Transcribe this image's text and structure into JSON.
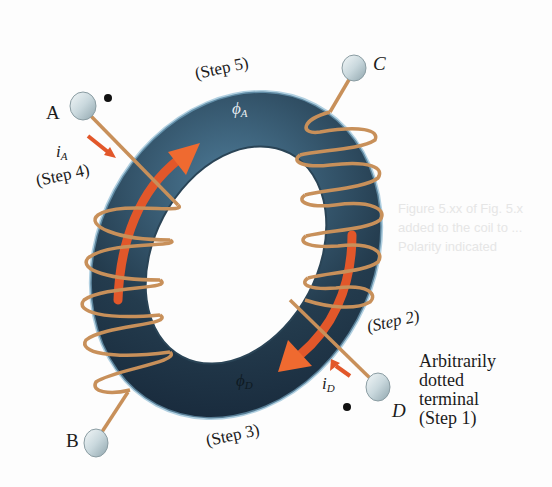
{
  "figure": {
    "type": "toroidal transformer dot-convention diagram",
    "terminals": [
      {
        "id": "A",
        "label": "A",
        "dotted": true
      },
      {
        "id": "B",
        "label": "B",
        "dotted": false
      },
      {
        "id": "C",
        "label": "C",
        "dotted": false
      },
      {
        "id": "D",
        "label": "D",
        "dotted": true
      }
    ],
    "currents": {
      "iA": {
        "symbol": "i",
        "subscript": "A"
      },
      "iD": {
        "symbol": "i",
        "subscript": "D"
      }
    },
    "fluxes": {
      "phiA": {
        "symbol": "ϕ",
        "subscript": "A"
      },
      "phiD": {
        "symbol": "ϕ",
        "subscript": "D"
      }
    },
    "steps": {
      "step1": "(Step 1)",
      "step2": "(Step 2)",
      "step3": "(Step 3)",
      "step4": "(Step 4)",
      "step5": "(Step 5)"
    },
    "note": {
      "line1": "Arbitrarily",
      "line2": "dotted",
      "line3": "terminal",
      "line4": "(Step 1)"
    },
    "colors": {
      "core": "#1f3444",
      "core_highlight": "#5d8fb0",
      "winding": "#c8905a",
      "flux_arrow": "#e2572a",
      "terminal": "#d4e0e4",
      "dot": "#111111"
    }
  },
  "ghost_text": {
    "line1": "Figure 5.xx of Fig. 5.x",
    "line2": "added to the coil to ...",
    "line3": "Polarity indicated"
  }
}
